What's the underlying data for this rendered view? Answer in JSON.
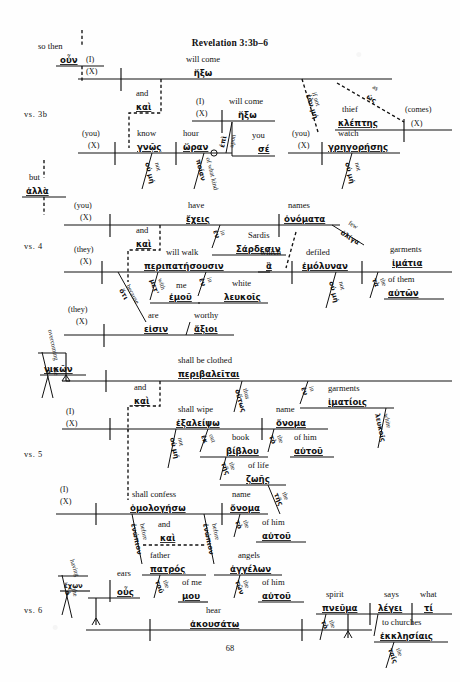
{
  "page": {
    "title": "Revelation 3:3b–6",
    "page_number": "68",
    "verse_labels": [
      "vs. 3b",
      "vs. 4",
      "vs. 5",
      "vs. 6"
    ]
  },
  "connectors": [
    {
      "en": "so then",
      "gr": "οὖν"
    },
    {
      "en": "but",
      "gr": "ἀλλὰ"
    },
    {
      "en": "and",
      "gr": "καὶ"
    }
  ],
  "clauses": [
    {
      "id": "c1",
      "verse": "vs. 3b",
      "subject_en": "(I)",
      "subject_gr": "(X)",
      "verb_en": "will come",
      "verb_gr": "ἥξω",
      "modifiers": [
        {
          "en": "if not",
          "gr": "ἐὰν μή"
        },
        {
          "en": "as",
          "gr": "ὡς"
        },
        {
          "en": "thief",
          "gr": "κλέπτης"
        },
        {
          "en": "(comes)",
          "gr": "(X)"
        }
      ]
    },
    {
      "id": "c2",
      "verse": "vs. 3b",
      "subject_en": "(you)",
      "subject_gr": "(X)",
      "verb_en": "know",
      "verb_gr": "γνῷς",
      "conj_en": "and",
      "conj_gr": "καὶ",
      "modifiers": [
        {
          "en": "not",
          "gr": "οὐ μή"
        },
        {
          "en": "hour",
          "gr": "ὥραν"
        },
        {
          "en": "of what kind",
          "gr": "ποίαν"
        },
        {
          "en": "upon",
          "gr": "ἐπὶ"
        },
        {
          "en": "you",
          "gr": "σέ"
        }
      ]
    },
    {
      "id": "c3",
      "verse": "vs. 3b",
      "subject_en": "(I)",
      "subject_gr": "(X)",
      "verb_en": "will come",
      "verb_gr": "ἥξω"
    },
    {
      "id": "c4",
      "verse": "vs. 3b",
      "subject_en": "(you)",
      "subject_gr": "(X)",
      "verb_en": "watch",
      "verb_gr": "γρηγορήσης",
      "modifiers": [
        {
          "en": "not",
          "gr": "οὐ μή"
        }
      ]
    },
    {
      "id": "c5",
      "verse": "vs. 4",
      "subject_en": "(you)",
      "subject_gr": "(X)",
      "verb_en": "have",
      "verb_gr": "ἔχεις",
      "modifiers": [
        {
          "en": "in",
          "gr": "ἐν"
        },
        {
          "en": "Sardis",
          "gr": "Σάρδεσιν"
        },
        {
          "en": "names",
          "gr": "ὀνόματα"
        },
        {
          "en": "few",
          "gr": "ὀλίγα"
        }
      ]
    },
    {
      "id": "c6",
      "verse": "vs. 4",
      "subject_en": "(they)",
      "subject_gr": "(X)",
      "verb_en": "will walk",
      "verb_gr": "περιπατήσουσιν",
      "conj_en": "and",
      "conj_gr": "καὶ",
      "modifiers": [
        {
          "en": "with",
          "gr": "μετ'"
        },
        {
          "en": "me",
          "gr": "ἐμοῦ"
        },
        {
          "en": "in",
          "gr": "ἐν"
        },
        {
          "en": "white",
          "gr": "λευκοῖς"
        },
        {
          "en": "which",
          "gr": "ἃ"
        },
        {
          "en": "defiled",
          "gr": "ἐμόλυναν"
        },
        {
          "en": "not",
          "gr": "οὐ μή"
        },
        {
          "en": "the",
          "gr": "τὰ"
        },
        {
          "en": "garments",
          "gr": "ἱμάτια"
        },
        {
          "en": "of them",
          "gr": "αὐτῶν"
        }
      ]
    },
    {
      "id": "c7",
      "verse": "vs. 4",
      "subject_en": "(they)",
      "subject_gr": "(X)",
      "verb_en": "are",
      "verb_gr": "εἰσιν",
      "modifiers": [
        {
          "en": "because",
          "gr": "ὅτι"
        },
        {
          "en": "worthy",
          "gr": "ἄξιοι"
        }
      ]
    },
    {
      "id": "c8",
      "verse": "vs. 5",
      "subject_en": "overcoming",
      "subject_gr": "νικῶν",
      "article_en": "the",
      "article_gr": "ὁ",
      "verb_en": "shall be clothed",
      "verb_gr": "περιβαλεῖται",
      "modifiers": [
        {
          "en": "thus",
          "gr": "οὕτως"
        },
        {
          "en": "in",
          "gr": "ἐν"
        },
        {
          "en": "garments",
          "gr": "ἱματίοις"
        },
        {
          "en": "white",
          "gr": "λευκοῖς"
        }
      ]
    },
    {
      "id": "c9",
      "verse": "vs. 5",
      "subject_en": "(I)",
      "subject_gr": "(X)",
      "verb_en": "shall wipe",
      "verb_gr": "ἐξαλείψω",
      "conj_en": "and",
      "conj_gr": "καὶ",
      "modifiers": [
        {
          "en": "not",
          "gr": "οὐ μή"
        },
        {
          "en": "out",
          "gr": "ἐκ"
        },
        {
          "en": "the",
          "gr": "τῆς"
        },
        {
          "en": "book",
          "gr": "βίβλου"
        },
        {
          "en": "the",
          "gr": "τῆς"
        },
        {
          "en": "of life",
          "gr": "ζωῆς"
        },
        {
          "en": "the",
          "gr": "τὸ"
        },
        {
          "en": "name",
          "gr": "ὄνομα"
        },
        {
          "en": "of him",
          "gr": "αὐτοῦ"
        }
      ]
    },
    {
      "id": "c10",
      "verse": "vs. 5",
      "subject_en": "(I)",
      "subject_gr": "(X)",
      "verb_en": "shall confess",
      "verb_gr": "ὁμολογήσω",
      "conj_en": "and",
      "conj_gr": "καὶ",
      "modifiers": [
        {
          "en": "before",
          "gr": "ἐνώπιον"
        },
        {
          "en": "father",
          "gr": "πατρός"
        },
        {
          "en": "the",
          "gr": "τοῦ"
        },
        {
          "en": "of me",
          "gr": "μου"
        },
        {
          "en": "before",
          "gr": "ἐνώπιον"
        },
        {
          "en": "angels",
          "gr": "ἀγγέλων"
        },
        {
          "en": "the",
          "gr": "τῶν"
        },
        {
          "en": "of him",
          "gr": "αὐτοῦ"
        },
        {
          "en": "the",
          "gr": "τὸ"
        },
        {
          "en": "name",
          "gr": "ὄνομα"
        },
        {
          "en": "of him",
          "gr": "αὐτοῦ"
        }
      ]
    },
    {
      "id": "c11",
      "verse": "vs. 6",
      "subject_en": "having",
      "subject_gr": "ἔχων",
      "article_en": "the",
      "article_gr": "ὁ",
      "verb_en": "hear",
      "verb_gr": "ἀκουσάτω",
      "modifiers": [
        {
          "en": "ears",
          "gr": "οὖς"
        },
        {
          "en": "what",
          "gr": "τί"
        },
        {
          "en": "says",
          "gr": "λέγει"
        },
        {
          "en": "spirit",
          "gr": "πνεῦμα"
        },
        {
          "en": "the",
          "gr": "τὸ"
        },
        {
          "en": "to churches",
          "gr": "ἐκκλησίαις"
        },
        {
          "en": "the",
          "gr": "ταῖς"
        }
      ]
    }
  ]
}
